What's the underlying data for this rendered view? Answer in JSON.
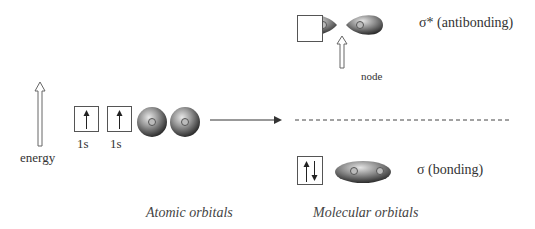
{
  "diagram": {
    "type": "molecular-orbital-diagram",
    "energy_axis": {
      "label": "energy"
    },
    "atomic_orbitals": {
      "caption": "Atomic orbitals",
      "orbitals": [
        {
          "label": "1s",
          "electrons": "up"
        },
        {
          "label": "1s",
          "electrons": "up"
        }
      ]
    },
    "molecular_orbitals": {
      "caption": "Molecular orbitals",
      "antibonding": {
        "label": "σ* (antibonding)",
        "electrons": "empty",
        "node_label": "node"
      },
      "bonding": {
        "label": "σ (bonding)",
        "electrons": "up-down"
      }
    }
  }
}
